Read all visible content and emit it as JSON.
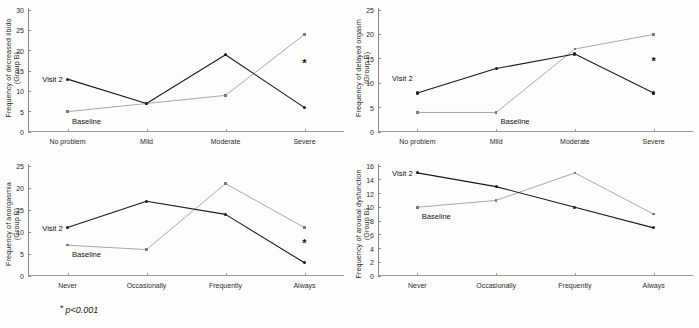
{
  "figure": {
    "footnote_symbol": "*",
    "footnote_text": "p<0.001",
    "series_colors": {
      "visit2": "#1a1a1a",
      "baseline": "#7a7a7a"
    }
  },
  "chart_data": [
    {
      "id": "decreased-libido",
      "type": "line",
      "title": "",
      "ylabel_line1": "Frequency of decreased libido",
      "ylabel_line2": "(Group B)",
      "xlabel": "",
      "categories": [
        "No problem",
        "Mild",
        "Moderate",
        "Severe"
      ],
      "ylim": [
        0,
        30
      ],
      "yticks": [
        0,
        5,
        10,
        15,
        20,
        25,
        30
      ],
      "grid": false,
      "legend_position": "inline-annotation",
      "series": [
        {
          "name": "Visit 2",
          "values": [
            13,
            7,
            19,
            6
          ],
          "color": "#1a1a1a"
        },
        {
          "name": "Baseline",
          "values": [
            5,
            7,
            9,
            24
          ],
          "color": "#7a7a7a"
        }
      ],
      "annotations": [
        {
          "text": "Visit 2",
          "category_index": 0,
          "value": 13,
          "placement": "left"
        },
        {
          "text": "Baseline",
          "category_index": 0,
          "value": 5,
          "placement": "below"
        },
        {
          "text": "*",
          "category_index": 3,
          "value": 17,
          "placement": "star"
        }
      ]
    },
    {
      "id": "delayed-orgasm",
      "type": "line",
      "title": "",
      "ylabel_line1": "Frequency of delayed orgasm",
      "ylabel_line2": "(Group B)",
      "xlabel": "",
      "categories": [
        "No problem",
        "Mild",
        "Moderate",
        "Severe"
      ],
      "ylim": [
        0,
        25
      ],
      "yticks": [
        0,
        5,
        10,
        15,
        20,
        25
      ],
      "grid": false,
      "legend_position": "inline-annotation",
      "series": [
        {
          "name": "Visit 2",
          "values": [
            8,
            13,
            16,
            8
          ],
          "color": "#1a1a1a"
        },
        {
          "name": "Baseline",
          "values": [
            4,
            4,
            17,
            20
          ],
          "color": "#7a7a7a"
        }
      ],
      "annotations": [
        {
          "text": "Visit 2",
          "category_index": 0,
          "value": 11,
          "placement": "left"
        },
        {
          "text": "Baseline",
          "category_index": 1,
          "value": 4,
          "placement": "below"
        },
        {
          "text": "*",
          "category_index": 3,
          "value": 14.5,
          "placement": "star"
        }
      ]
    },
    {
      "id": "anorgasmia",
      "type": "line",
      "title": "",
      "ylabel_line1": "Frequency of anorgasmia",
      "ylabel_line2": "(Group B)",
      "xlabel": "",
      "categories": [
        "Never",
        "Occasionally",
        "Frequently",
        "Always"
      ],
      "ylim": [
        0,
        25
      ],
      "yticks": [
        0,
        5,
        10,
        15,
        20,
        25
      ],
      "grid": false,
      "legend_position": "inline-annotation",
      "series": [
        {
          "name": "Visit 2",
          "values": [
            11,
            17,
            14,
            3
          ],
          "color": "#1a1a1a"
        },
        {
          "name": "Baseline",
          "values": [
            7,
            6,
            21,
            11
          ],
          "color": "#7a7a7a"
        }
      ],
      "annotations": [
        {
          "text": "Visit 2",
          "category_index": 0,
          "value": 11,
          "placement": "left"
        },
        {
          "text": "Baseline",
          "category_index": 0,
          "value": 7,
          "placement": "below"
        },
        {
          "text": "*",
          "category_index": 3,
          "value": 7.5,
          "placement": "star"
        }
      ]
    },
    {
      "id": "arousal-dysfunction",
      "type": "line",
      "title": "",
      "ylabel_line1": "Frequency of arousal dysfunction",
      "ylabel_line2": "(Group B)",
      "xlabel": "",
      "categories": [
        "Never",
        "Occasionally",
        "Frequently",
        "Always"
      ],
      "ylim": [
        0,
        16
      ],
      "yticks": [
        0,
        2,
        4,
        6,
        8,
        10,
        12,
        14,
        16
      ],
      "grid": false,
      "legend_position": "inline-annotation",
      "series": [
        {
          "name": "Visit 2",
          "values": [
            15,
            13,
            10,
            7
          ],
          "color": "#1a1a1a"
        },
        {
          "name": "Baseline",
          "values": [
            10,
            11,
            15,
            9
          ],
          "color": "#7a7a7a"
        }
      ],
      "annotations": [
        {
          "text": "Visit 2",
          "category_index": 0,
          "value": 15,
          "placement": "left"
        },
        {
          "text": "Baseline",
          "category_index": 0,
          "value": 10,
          "placement": "below"
        }
      ]
    }
  ]
}
